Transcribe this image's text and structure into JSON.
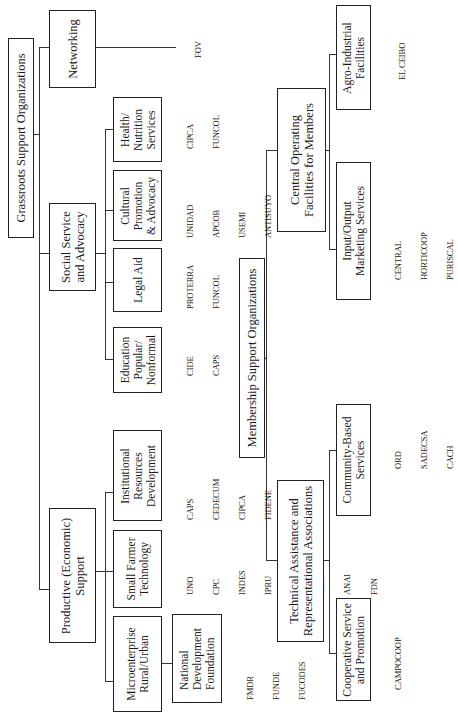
{
  "diagram": {
    "type": "organizational-chart",
    "orientation": "rotated-90-ccw",
    "root": {
      "label": "Grassroots Support Organizations",
      "children": [
        {
          "label": "Networking",
          "orgs": [
            "FOV"
          ]
        },
        {
          "label": "Social Service and Advocacy",
          "line1": "Social Service",
          "line2": "and Advocacy",
          "children": [
            {
              "label": "Health/ Nutrition Services",
              "lines": [
                "Health/",
                "Nutrition",
                "Services"
              ],
              "orgs": [
                "CIPCA",
                "FUNCOL"
              ]
            },
            {
              "label": "Cultural Promotion & Advocacy",
              "lines": [
                "Cultural",
                "Promotion",
                "& Advocacy"
              ],
              "orgs": [
                "UNIDAD",
                "APCOB",
                "USEMI",
                "ANTISUYO"
              ]
            },
            {
              "label": "Legal Aid",
              "lines": [
                "Legal Aid"
              ],
              "orgs": [
                "PROTERRA",
                "FUNCOL"
              ]
            },
            {
              "label": "Education Popular/ Nonformal",
              "lines": [
                "Education",
                "Popular/",
                "Nonformal"
              ],
              "orgs": [
                "CIDE",
                "CAPS"
              ]
            }
          ]
        },
        {
          "label": "Productive (Economic) Support",
          "line1": "Productive (Economic)",
          "line2": "Support",
          "children": [
            {
              "label": "Institutional Resources Development",
              "lines": [
                "Institutional",
                "Resources",
                "Development"
              ],
              "orgs": [
                "CAPS",
                "CEDECUM",
                "CIPCA",
                "FIDENE"
              ]
            },
            {
              "label": "Small Farmer Technology",
              "lines": [
                "Small Farmer",
                "Technology"
              ],
              "orgs": [
                "UNO",
                "CPC",
                "INDES",
                "IPRU",
                "PROTERRA",
                "CET",
                "ANAI",
                "FDN"
              ]
            },
            {
              "label": "Microenterprise Rural/Urban",
              "lines": [
                "Microenterprise",
                "Rural/Urban"
              ],
              "children": [
                {
                  "label": "National Development Foundation",
                  "lines": [
                    "National",
                    "Development",
                    "Foundation"
                  ],
                  "orgs": [
                    "FMDR",
                    "FUNDE",
                    "FUCODES"
                  ]
                }
              ]
            }
          ]
        }
      ]
    },
    "root2": {
      "label": "Membership Support Organizations",
      "children": [
        {
          "label": "Central Operating Facilities for Members",
          "line1": "Central Operating",
          "line2": "Facilities for Members",
          "children": [
            {
              "label": "Agro-Industrial Facilities",
              "lines": [
                "Agro-Industrial",
                "Facilities"
              ],
              "orgs": [
                "EL CEIBO"
              ]
            },
            {
              "label": "Input/Output Marketing Services",
              "lines": [
                "Input/Output",
                "Marketing Services"
              ],
              "orgs": [
                "CENTRAL",
                "HORTICOOP",
                "PURISCAL"
              ]
            }
          ]
        },
        {
          "label": "Technical Assistance and Representational Associations",
          "line1": "Technical Assistance and",
          "line2": "Representational Associations",
          "children": [
            {
              "label": "Community-Based Services",
              "lines": [
                "Community-Based",
                "Services"
              ],
              "orgs": [
                "ORD",
                "SADECSA",
                "CACH"
              ]
            },
            {
              "label": "Cooperative Service and Promotion",
              "lines": [
                "Cooperative Service",
                "and Promotion"
              ],
              "orgs": [
                "CAMPOCOOP"
              ]
            }
          ]
        }
      ]
    }
  }
}
